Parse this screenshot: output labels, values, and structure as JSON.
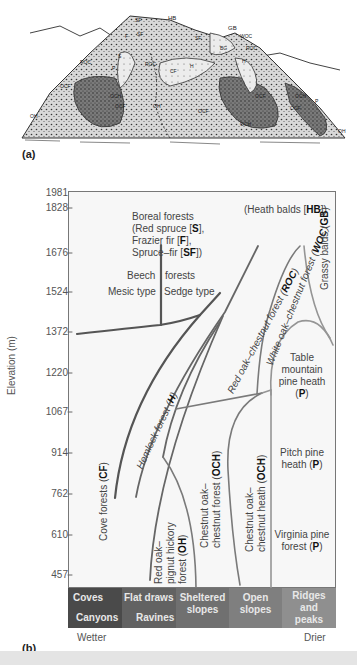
{
  "figure": {
    "panel_a_label": "(a)",
    "panel_b_label": "(b)",
    "panel_a_zone_labels": [
      "SF",
      "HB",
      "GB",
      "WOC",
      "SF",
      "BG",
      "F",
      "ROC",
      "S",
      "ROC",
      "ROC",
      "P",
      "CF",
      "H",
      "H",
      "OCF",
      "OCH",
      "OCF",
      "OH",
      "OCF",
      "OCH",
      "OCF",
      "OCH",
      "OCF",
      "OH",
      "P"
    ]
  },
  "axis": {
    "title": "Elevation (m)",
    "ticks": [
      "1981",
      "1828",
      "1676",
      "1524",
      "1372",
      "1220",
      "1067",
      "914",
      "762",
      "610",
      "457"
    ]
  },
  "zones": {
    "heath_balds": "(Heath balds [HB])",
    "heath_balds_pre": "(Heath balds [",
    "heath_balds_code": "HB",
    "heath_balds_post": "])",
    "boreal_l1": "Boreal forests",
    "boreal_l2_pre": "(Red spruce [",
    "boreal_l2_code": "S",
    "boreal_l2_post": "],",
    "boreal_l3_pre": "Frazier fir [",
    "boreal_l3_code": "F",
    "boreal_l3_post": "],",
    "boreal_l4_pre": "Spruce–fir [",
    "boreal_l4_code": "SF",
    "boreal_l4_post": "])",
    "beech_l1a": "Beech",
    "beech_l1b": "forests",
    "beech_mesic": "Mesic type",
    "beech_sedge": "Sedge type",
    "roc_pre": "Red oak–chestnut forest (",
    "roc_code": "ROC",
    "roc_post": ")",
    "woc_pre": "White oak–chestnut forest (",
    "woc_code": "WOC",
    "woc_post": ")",
    "gb_pre": "Grassy balds (",
    "gb_code": "GB",
    "gb_post": ")",
    "hemlock_pre": "Hemlock forest (",
    "hemlock_code": "H",
    "hemlock_post": ")",
    "table_l1": "Table",
    "table_l2": "mountain",
    "table_l3": "pine heath",
    "table_l4_pre": "(",
    "table_l4_code": "P",
    "table_l4_post": ")",
    "cove_pre": "Cove forests (",
    "cove_code": "CF",
    "cove_post": ")",
    "och_forest_l1": "Chestnut oak–",
    "och_forest_l2_pre": "chestnut forest (",
    "och_forest_code": "OCH",
    "och_forest_l2_post": ")",
    "och_heath_l1": "Chestnut oak–",
    "och_heath_l2_pre": "chestnut heath (",
    "och_heath_code": "OCH",
    "och_heath_l2_post": ")",
    "pitch_l1": "Pitch pine",
    "pitch_l2_pre": "heath (",
    "pitch_code": "P",
    "pitch_l2_post": ")",
    "oh_l1": "Red oak–",
    "oh_l2": "pignut hickory",
    "oh_l3_pre": "forest (",
    "oh_code": "OH",
    "oh_l3_post": ")",
    "virginia_l1": "Virginia pine",
    "virginia_l2_pre": "forest (",
    "virginia_code": "P",
    "virginia_l2_post": ")"
  },
  "moisture_band": {
    "cells": [
      {
        "line1": "Coves",
        "line2": "Canyons",
        "color": "#4a4a4a"
      },
      {
        "line1": "Flat draws",
        "line2": "Ravines",
        "color": "#5e5e5e"
      },
      {
        "line1": "Sheltered",
        "line2": "slopes",
        "color": "#6e6e6e"
      },
      {
        "line1": "Open",
        "line2": "slopes",
        "color": "#7d7d7d"
      },
      {
        "line1": "Ridges",
        "line2": "and",
        "line3": "peaks",
        "color": "#8e8e8e"
      }
    ],
    "left_label": "Wetter",
    "right_label": "Drier"
  },
  "colors": {
    "dark_line": "#555555",
    "mid_line": "#777777",
    "light_line": "#999999",
    "plot_bg": "#f7f7f7"
  }
}
